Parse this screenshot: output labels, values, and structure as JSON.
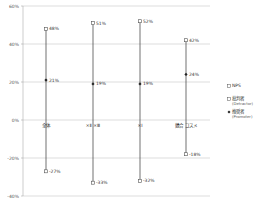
{
  "chart_data": {
    "type": "line",
    "title": "",
    "xlabel": "",
    "ylabel": "",
    "ylim": [
      -40,
      60
    ],
    "yticks": [
      60,
      40,
      20,
      0,
      -20,
      -40
    ],
    "ytick_labels": [
      "60%",
      "40%",
      "20%",
      "0%",
      "-20%",
      "-40%"
    ],
    "grid": true,
    "legend_position": "right",
    "categories": [
      "全体",
      "×Ⅱ ×Ⅲ",
      "×Ⅰ",
      "競合 コスメ"
    ],
    "series": [
      {
        "name": "NPS",
        "marker": "diamond",
        "values": [
          21,
          19,
          19,
          24
        ],
        "labels": [
          "21%",
          "19%",
          "19%",
          "24%"
        ]
      },
      {
        "name": "批判者",
        "sub": "(Detractor)",
        "marker": "square",
        "values": [
          -27,
          -33,
          -32,
          -18
        ],
        "labels": [
          "-27%",
          "-33%",
          "-32%",
          "-18%"
        ]
      },
      {
        "name": "推奨者",
        "sub": "(Promoter)",
        "marker": "square",
        "values": [
          48,
          51,
          52,
          42
        ],
        "labels": [
          "48%",
          "51%",
          "52%",
          "42%"
        ]
      }
    ],
    "legend": [
      {
        "label": "NPS"
      },
      {
        "label": "批判者",
        "sub": "(Detractor)"
      },
      {
        "label": "推奨者",
        "sub": "(Promoter)"
      }
    ],
    "colors": {
      "line": "#333333",
      "grid": "#c8c8c8",
      "marker": "#555555"
    }
  }
}
